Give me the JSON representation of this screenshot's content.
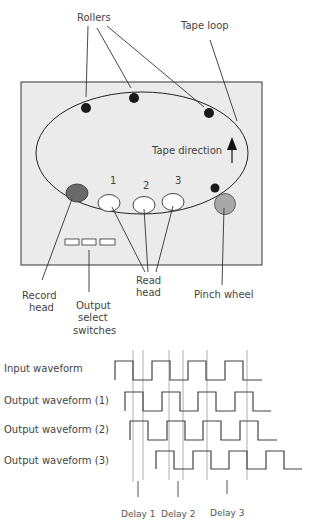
{
  "machine": {
    "labels": {
      "rollers": "Rollers",
      "tape_loop": "Tape loop",
      "tape_direction": "Tape direction",
      "record_head": [
        "Record",
        "head"
      ],
      "output_select": [
        "Output",
        "select",
        "switches"
      ],
      "read_head": [
        "Read",
        "head"
      ],
      "pinch_wheel": "Pinch wheel"
    },
    "read_head_numbers": [
      "1",
      "2",
      "3"
    ],
    "colors": {
      "panel": "#ebebeb",
      "record_head": "#6a6a6a",
      "pinch_wheel": "#a8a8a8",
      "roller": "#1a1a1a",
      "line": "#333333"
    }
  },
  "waveforms": {
    "rows": [
      {
        "label": "Input waveform"
      },
      {
        "label": "Output waveform (1)"
      },
      {
        "label": "Output waveform (2)"
      },
      {
        "label": "Output waveform (3)"
      }
    ],
    "delays": [
      "Delay 1",
      "Delay 2",
      "Delay 3"
    ]
  }
}
